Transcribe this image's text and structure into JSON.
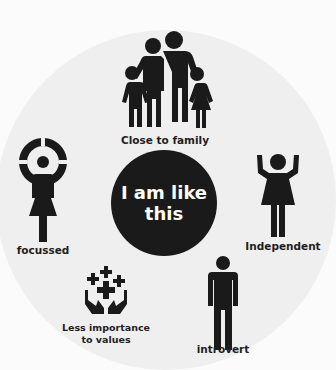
{
  "center": {
    "line1": "I am like",
    "line2": "this"
  },
  "traits": [
    {
      "id": "family",
      "label": "Close to family",
      "icon": "family-icon"
    },
    {
      "id": "focussed",
      "label": "focussed",
      "icon": "target-person-icon"
    },
    {
      "id": "independent",
      "label": "Independent",
      "icon": "cheering-woman-icon"
    },
    {
      "id": "values",
      "label_line1": "Less importance",
      "label_line2": "to values",
      "icon": "hands-plus-icon"
    },
    {
      "id": "introvert",
      "label": "introvert",
      "icon": "standing-man-icon"
    }
  ],
  "colors": {
    "icon": "#1a1a1a",
    "bg_circle": "#efefef",
    "center_text": "#ffffff"
  }
}
